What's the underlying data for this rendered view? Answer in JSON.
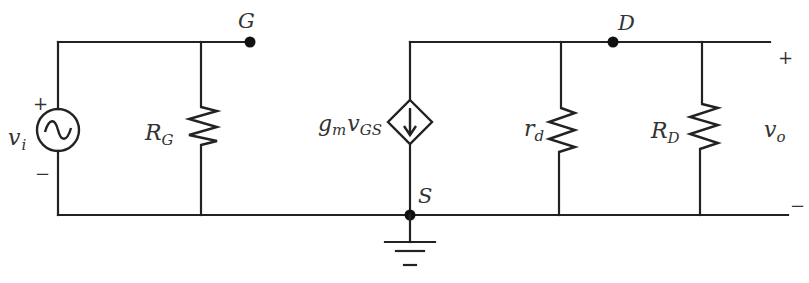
{
  "diagram": {
    "nodes": {
      "gate": "G",
      "drain": "D",
      "source": "S"
    },
    "input": {
      "symbol": "v",
      "subscript": "i",
      "plus": "+",
      "minus": "−"
    },
    "output": {
      "symbol": "v",
      "subscript": "o",
      "plus": "+",
      "minus": "−"
    },
    "components": {
      "gate_resistor": {
        "symbol": "R",
        "subscript": "G"
      },
      "dependent_source": {
        "prefix": "g",
        "prefix_sub": "m",
        "symbol": "v",
        "subscript": "GS"
      },
      "drain_resistance": {
        "symbol": "r",
        "subscript": "d"
      },
      "drain_resistor": {
        "symbol": "R",
        "subscript": "D"
      }
    },
    "colors": {
      "stroke": "#222222",
      "text": "#333333",
      "background": "#ffffff"
    }
  }
}
